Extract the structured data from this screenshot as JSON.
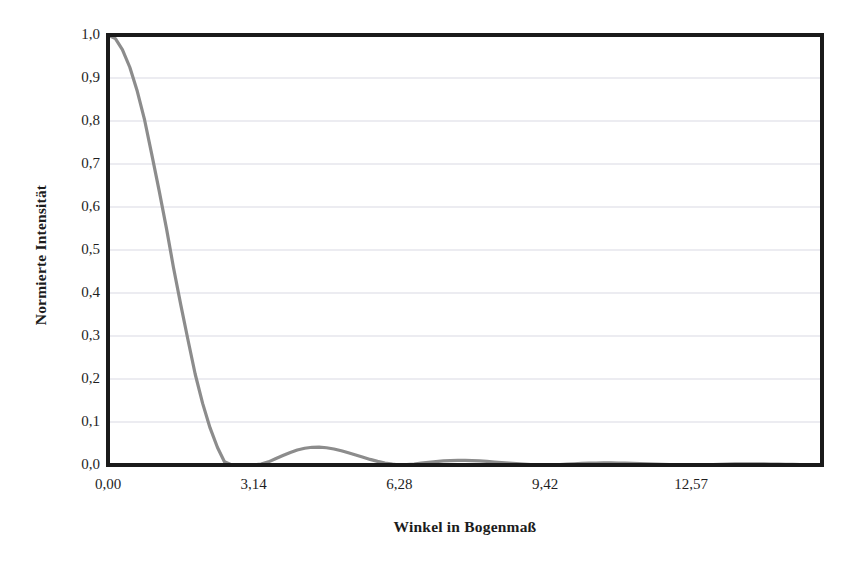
{
  "chart_data": {
    "type": "line",
    "title": "",
    "subtitle": "",
    "xlabel": "Winkel in Bogenmaß",
    "ylabel": "Normierte Intensität",
    "xlim": [
      0,
      15.39
    ],
    "ylim": [
      0,
      1.0
    ],
    "grid": "horizontal",
    "legend": "none",
    "xticks": [
      0,
      3.14,
      6.28,
      9.42,
      12.57
    ],
    "xticklabels": [
      "0,00",
      "3,14",
      "6,28",
      "9,42",
      "12,57"
    ],
    "yticks": [
      0.0,
      0.1,
      0.2,
      0.3,
      0.4,
      0.5,
      0.6,
      0.7,
      0.8,
      0.9,
      1.0
    ],
    "yticklabels": [
      "0,0",
      "0,1",
      "0,2",
      "0,3",
      "0,4",
      "0,5",
      "0,6",
      "0,7",
      "0,8",
      "0,9",
      "1,0"
    ],
    "series": [
      {
        "name": "sinc-squared",
        "color": "#8c8c8c",
        "linewidth": 3.2,
        "formula": "sin(x)^2 / x^2",
        "description": "Einzelspalt-Beugungsintensität (sinc-Quadrat)",
        "x": [
          0.0,
          0.16,
          0.31,
          0.47,
          0.63,
          0.79,
          0.94,
          1.1,
          1.26,
          1.41,
          1.57,
          1.73,
          1.88,
          2.04,
          2.2,
          2.36,
          2.51,
          2.67,
          2.83,
          2.98,
          3.14,
          3.3,
          3.46,
          3.61,
          3.77,
          3.93,
          4.08,
          4.24,
          4.4,
          4.55,
          4.71,
          4.87,
          5.03,
          5.18,
          5.34,
          5.5,
          5.65,
          5.81,
          5.97,
          6.13,
          6.28,
          6.44,
          6.6,
          6.75,
          6.91,
          7.07,
          7.23,
          7.38,
          7.54,
          7.7,
          7.85,
          8.01,
          8.17,
          8.33,
          8.48,
          8.64,
          8.8,
          8.95,
          9.11,
          9.27,
          9.42,
          9.58,
          9.74,
          9.9,
          10.05,
          10.21,
          10.37,
          10.52,
          10.68,
          10.84,
          11.0,
          11.15,
          11.31,
          11.47,
          11.62,
          11.78,
          11.94,
          12.1,
          12.25,
          12.41,
          12.57,
          12.72,
          12.88,
          13.04,
          13.19,
          13.35,
          13.51,
          13.67,
          13.82,
          13.98,
          14.14,
          14.29,
          14.45,
          14.61,
          14.76,
          14.92,
          15.08,
          15.24,
          15.39
        ],
        "y": [
          1.0,
          0.9915,
          0.9662,
          0.925,
          0.8696,
          0.8018,
          0.7242,
          0.6394,
          0.5504,
          0.4601,
          0.3717,
          0.2878,
          0.211,
          0.1433,
          0.0862,
          0.0408,
          0.0077,
          0.0,
          0.0,
          0.0,
          0.0,
          0.0021,
          0.0073,
          0.0144,
          0.0219,
          0.029,
          0.0348,
          0.0389,
          0.0412,
          0.0415,
          0.0401,
          0.0372,
          0.0332,
          0.0284,
          0.0233,
          0.018,
          0.013,
          0.0085,
          0.0047,
          0.0019,
          0.0,
          0.0008,
          0.0023,
          0.0042,
          0.0062,
          0.008,
          0.0094,
          0.0104,
          0.0108,
          0.0108,
          0.0103,
          0.0094,
          0.0083,
          0.007,
          0.0056,
          0.0043,
          0.003,
          0.0019,
          0.001,
          0.0004,
          0.0,
          0.0004,
          0.0011,
          0.002,
          0.0029,
          0.0037,
          0.0043,
          0.0047,
          0.0049,
          0.0048,
          0.0046,
          0.0042,
          0.0037,
          0.0031,
          0.0025,
          0.0019,
          0.0013,
          0.0008,
          0.0004,
          0.0002,
          0.0,
          0.0002,
          0.0006,
          0.0011,
          0.0016,
          0.002,
          0.0024,
          0.0026,
          0.0027,
          0.0027,
          0.0025,
          0.0023,
          0.002,
          0.0017,
          0.0014,
          0.001,
          0.0007,
          0.0004,
          0.0003
        ]
      }
    ],
    "annotations": {
      "main_peak_value": 1.0,
      "first_minimum_x": 3.14,
      "first_sidelobe_peak": 0.047,
      "second_sidelobe_peak": 0.017,
      "third_sidelobe_peak": 0.008
    }
  },
  "axes": {
    "frame_color": "#1a1a1a",
    "grid_color": "#d9d9e3",
    "plot_background": "#ffffff"
  }
}
